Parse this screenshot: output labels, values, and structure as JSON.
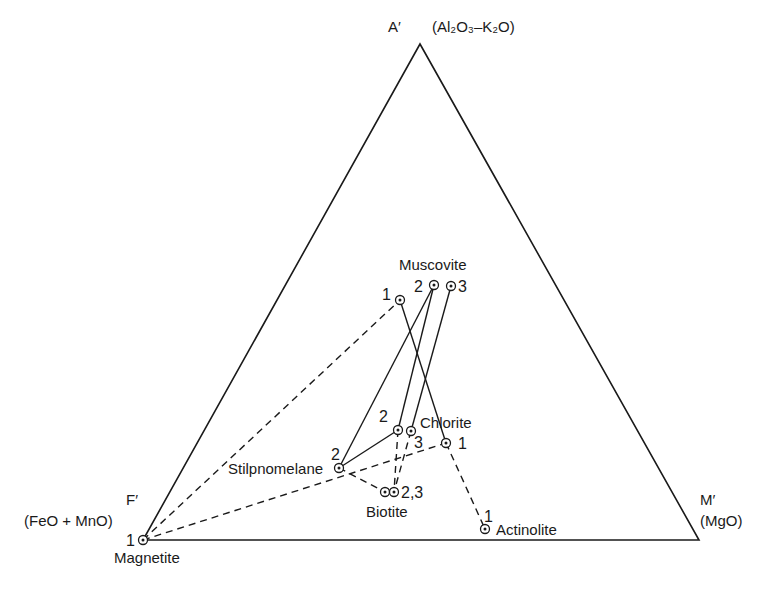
{
  "diagram": {
    "type": "ternary",
    "vertices": {
      "A": {
        "label": "A′",
        "formula": "(Al₂O₃–K₂O)",
        "x": 420,
        "y": 44
      },
      "F": {
        "label": "F′",
        "formula": "(FeO + MnO)",
        "x": 143,
        "y": 540
      },
      "M": {
        "label": "M′",
        "formula": "(MgO)",
        "x": 699,
        "y": 540
      }
    },
    "minerals": {
      "muscovite": "Muscovite",
      "chlorite": "Chlorite",
      "stilpnomelane": "Stilpnomelane",
      "biotite": "Biotite",
      "actinolite": "Actinolite",
      "magnetite": "Magnetite"
    },
    "points": [
      {
        "id": "musc1",
        "mineral": "Muscovite",
        "sample": "1",
        "x": 400,
        "y": 300
      },
      {
        "id": "musc2",
        "mineral": "Muscovite",
        "sample": "2",
        "x": 434,
        "y": 285
      },
      {
        "id": "musc3",
        "mineral": "Muscovite",
        "sample": "3",
        "x": 451,
        "y": 286
      },
      {
        "id": "chl1",
        "mineral": "Chlorite",
        "sample": "1",
        "x": 446,
        "y": 443
      },
      {
        "id": "chl2",
        "mineral": "Chlorite",
        "sample": "2",
        "x": 398,
        "y": 430
      },
      {
        "id": "chl3",
        "mineral": "Chlorite",
        "sample": "3",
        "x": 411,
        "y": 431
      },
      {
        "id": "stilp2",
        "mineral": "Stilpnomelane",
        "sample": "2",
        "x": 339,
        "y": 468
      },
      {
        "id": "bio2",
        "mineral": "Biotite",
        "sample": "2",
        "x": 385,
        "y": 492
      },
      {
        "id": "bio3",
        "mineral": "Biotite",
        "sample": "3",
        "x": 394,
        "y": 492
      },
      {
        "id": "act1",
        "mineral": "Actinolite",
        "sample": "1",
        "x": 485,
        "y": 529
      },
      {
        "id": "mag1",
        "mineral": "Magnetite",
        "sample": "1",
        "x": 143,
        "y": 540
      }
    ],
    "tie_lines": {
      "solid": [
        [
          "musc1",
          "chl1"
        ],
        [
          "musc2",
          "stilp2"
        ],
        [
          "musc2",
          "chl2"
        ],
        [
          "musc3",
          "chl3"
        ],
        [
          "stilp2",
          "chl2"
        ]
      ],
      "dashed": [
        [
          "mag1",
          "musc1"
        ],
        [
          "mag1",
          "chl1"
        ],
        [
          "stilp2",
          "bio2"
        ],
        [
          "chl2",
          "bio3"
        ],
        [
          "chl3",
          "bio3"
        ],
        [
          "chl1",
          "act1"
        ]
      ]
    },
    "sample_labels": {
      "musc1": "1",
      "musc2": "2",
      "musc3": "3",
      "chl1": "1",
      "chl2": "2",
      "chl3": "3",
      "stilp2": "2",
      "bio": "2,3",
      "act1": "1",
      "mag1": "1"
    }
  }
}
